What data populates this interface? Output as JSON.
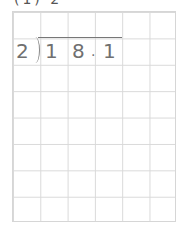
{
  "header": {
    "cut_text": "(1) 2"
  },
  "problem": {
    "divisor": "2",
    "dividend_digits": [
      "1",
      "8",
      ".",
      "1"
    ]
  },
  "grid": {
    "columns": 6,
    "rows": 8
  },
  "colors": {
    "grid_line": "#d9d9d9",
    "digit": "#707070",
    "vinculum": "#777777"
  }
}
